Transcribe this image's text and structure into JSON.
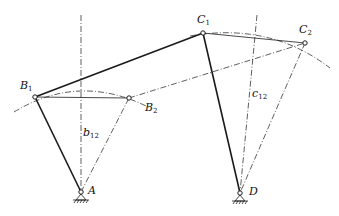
{
  "diagram": {
    "type": "four-bar linkage synthesis (two positions)",
    "colors": {
      "stroke": "#1a1a1a",
      "background": "#ffffff"
    },
    "points": {
      "B1": {
        "label": "B",
        "sub": "1",
        "x": 35,
        "y": 97
      },
      "B2": {
        "label": "B",
        "sub": "2",
        "x": 129,
        "y": 98
      },
      "C1": {
        "label": "C",
        "sub": "1",
        "x": 203,
        "y": 33
      },
      "C2": {
        "label": "C",
        "sub": "2",
        "x": 305,
        "y": 43
      },
      "A": {
        "label": "A",
        "x": 81,
        "y": 192
      },
      "D": {
        "label": "D",
        "x": 240,
        "y": 193
      }
    },
    "bisectors": {
      "b12": {
        "label": "b",
        "sub": "12"
      },
      "c12": {
        "label": "c",
        "sub": "12"
      }
    },
    "links": [
      {
        "from": "A",
        "to": "B1",
        "style": "solid-thick"
      },
      {
        "from": "B1",
        "to": "C1",
        "style": "solid-thick"
      },
      {
        "from": "C1",
        "to": "D",
        "style": "solid-thick"
      },
      {
        "from": "A",
        "to": "B2",
        "style": "dash-dot"
      },
      {
        "from": "B2",
        "to": "C2",
        "style": "dash-dot"
      },
      {
        "from": "C2",
        "to": "D",
        "style": "dash-dot"
      },
      {
        "from": "B1",
        "to": "B2",
        "style": "solid-thin"
      },
      {
        "from": "C1",
        "to": "C2",
        "style": "solid-thin"
      }
    ]
  }
}
